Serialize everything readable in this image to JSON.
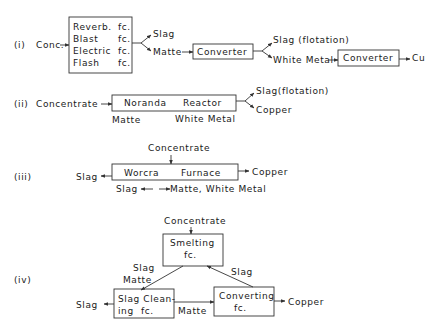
{
  "diagram": {
    "i": {
      "label": "(i)",
      "input": "Conc.",
      "furnace_rows": [
        {
          "name": "Reverb.",
          "suffix": "fc."
        },
        {
          "name": "Blast",
          "suffix": "fc."
        },
        {
          "name": "Electric",
          "suffix": "fc."
        },
        {
          "name": "Flash",
          "suffix": "fc."
        }
      ],
      "slag": "Slag",
      "matte": "Matte",
      "converter1": "Converter",
      "slag_flotation": "Slag (flotation)",
      "white_metal": "White Metal",
      "converter2": "Converter",
      "product": "Cu"
    },
    "ii": {
      "label": "(ii)",
      "input": "Concentrate",
      "reactor_left": "Noranda",
      "reactor_right": "Reactor",
      "matte": "Matte",
      "white_metal": "White Metal",
      "slag_flotation": "Slag(flotation)",
      "product": "Copper"
    },
    "iii": {
      "label": "(iii)",
      "input": "Concentrate",
      "furnace_left": "Worcra",
      "furnace_right": "Furnace",
      "slag_out": "Slag",
      "product": "Copper",
      "flow_slag": "Slag",
      "flow_matte": "Matte, White Metal"
    },
    "iv": {
      "label": "(iv)",
      "input": "Concentrate",
      "smelting_line1": "Smelting",
      "smelting_line2": "fc.",
      "slag_label": "Slag",
      "matte_label": "Matte",
      "return_slag": "Slag",
      "cleaning_line1": "Slag Clean-",
      "cleaning_line2_a": "ing",
      "cleaning_line2_b": "fc.",
      "slag_out": "Slag",
      "matte_flow": "Matte",
      "converting_line1": "Converting",
      "converting_line2": "fc.",
      "product": "Copper"
    }
  }
}
